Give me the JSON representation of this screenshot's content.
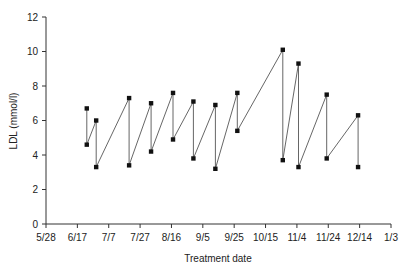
{
  "chart_data": {
    "type": "line",
    "title": "",
    "xlabel": "Treatment date",
    "ylabel": "LDL (mmol/l)",
    "ylim": [
      0,
      12
    ],
    "yticks": [
      0,
      2,
      4,
      6,
      8,
      10,
      12
    ],
    "xtick_labels": [
      "5/28",
      "6/17",
      "7/7",
      "7/27",
      "8/16",
      "9/5",
      "9/25",
      "10/15",
      "11/4",
      "11/24",
      "12/14",
      "1/3"
    ],
    "grid": false,
    "legend": null,
    "series": [
      {
        "name": "LDL",
        "points": [
          {
            "date": "6/23",
            "day": 26,
            "value": 6.7
          },
          {
            "date": "6/23",
            "day": 26,
            "value": 4.6
          },
          {
            "date": "6/29",
            "day": 32,
            "value": 6.0
          },
          {
            "date": "6/29",
            "day": 32,
            "value": 3.3
          },
          {
            "date": "7/20",
            "day": 53,
            "value": 7.3
          },
          {
            "date": "7/20",
            "day": 53,
            "value": 3.4
          },
          {
            "date": "8/2",
            "day": 67,
            "value": 7.0
          },
          {
            "date": "8/2",
            "day": 67,
            "value": 4.2
          },
          {
            "date": "8/17",
            "day": 81,
            "value": 7.6
          },
          {
            "date": "8/17",
            "day": 81,
            "value": 4.9
          },
          {
            "date": "8/30",
            "day": 94,
            "value": 7.1
          },
          {
            "date": "8/30",
            "day": 94,
            "value": 3.8
          },
          {
            "date": "9/13",
            "day": 108,
            "value": 6.9
          },
          {
            "date": "9/13",
            "day": 108,
            "value": 3.2
          },
          {
            "date": "9/27",
            "day": 122,
            "value": 7.6
          },
          {
            "date": "9/27",
            "day": 122,
            "value": 5.4
          },
          {
            "date": "10/26",
            "day": 151,
            "value": 10.1
          },
          {
            "date": "10/26",
            "day": 151,
            "value": 3.7
          },
          {
            "date": "11/5",
            "day": 161,
            "value": 9.3
          },
          {
            "date": "11/5",
            "day": 161,
            "value": 3.3
          },
          {
            "date": "11/23",
            "day": 179,
            "value": 7.5
          },
          {
            "date": "11/23",
            "day": 179,
            "value": 3.8
          },
          {
            "date": "12/13",
            "day": 199,
            "value": 6.3
          },
          {
            "date": "12/13",
            "day": 199,
            "value": 3.3
          }
        ]
      }
    ],
    "x_range_days": [
      0,
      220
    ],
    "line_color": "#555555",
    "marker_color": "#111111"
  }
}
